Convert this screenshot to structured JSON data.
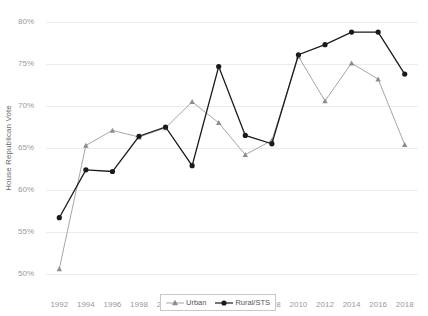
{
  "chart_data": {
    "type": "line",
    "title": "",
    "xlabel": "",
    "ylabel": "House Republican Vote",
    "categories": [
      1992,
      1994,
      1996,
      1998,
      2000,
      2002,
      2004,
      2006,
      2008,
      2010,
      2012,
      2014,
      2016,
      2018
    ],
    "xlim": [
      1991,
      2019
    ],
    "ylim": [
      50,
      80
    ],
    "yticks": [
      50,
      55,
      60,
      65,
      70,
      75,
      80
    ],
    "ytick_labels": [
      "50%",
      "55%",
      "60%",
      "65%",
      "70%",
      "75%",
      "80%"
    ],
    "xtick_labels": [
      "1992",
      "1994",
      "1996",
      "1998",
      "2000",
      "2002",
      "2004",
      "2006",
      "2008",
      "2010",
      "2012",
      "2014",
      "2016",
      "2018"
    ],
    "grid": "horizontal",
    "legend_position": "bottom-center",
    "series": [
      {
        "name": "Urban",
        "color": "#a6a6a6",
        "marker": "triangle",
        "values": [
          50.6,
          65.3,
          67.1,
          66.3,
          67.4,
          70.5,
          68.0,
          64.2,
          65.9,
          75.9,
          70.6,
          75.1,
          73.2,
          65.4
        ]
      },
      {
        "name": "Rural/STS",
        "color": "#1a1a1a",
        "marker": "circle",
        "values": [
          56.7,
          62.4,
          62.2,
          66.4,
          67.5,
          62.9,
          74.7,
          66.5,
          65.5,
          76.1,
          77.3,
          78.8,
          78.8,
          73.8
        ]
      }
    ]
  },
  "legend": {
    "items": [
      {
        "label": "Urban"
      },
      {
        "label": "Rural/STS"
      }
    ]
  }
}
